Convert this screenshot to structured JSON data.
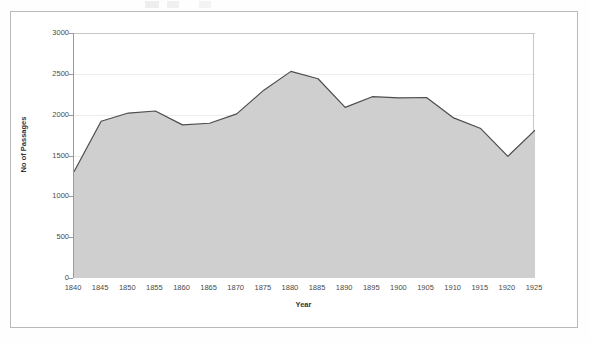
{
  "chart_data": {
    "type": "area",
    "title": "",
    "xlabel": "Year",
    "ylabel": "No of Passages",
    "x": [
      1840,
      1845,
      1850,
      1855,
      1860,
      1865,
      1870,
      1875,
      1880,
      1885,
      1890,
      1895,
      1900,
      1905,
      1910,
      1915,
      1920,
      1925
    ],
    "values": [
      1300,
      1920,
      2020,
      2045,
      1875,
      1895,
      2010,
      2300,
      2530,
      2440,
      2090,
      2220,
      2205,
      2210,
      1960,
      1830,
      1490,
      1810
    ],
    "xtick_labels": [
      "1840",
      "1845",
      "1850",
      "1855",
      "1860",
      "1865",
      "1870",
      "1875",
      "1880",
      "1885",
      "1890",
      "1895",
      "1900",
      "1905",
      "1910",
      "1915",
      "1920",
      "1925"
    ],
    "ytick_values": [
      0,
      500,
      1000,
      1500,
      2000,
      2500,
      3000
    ],
    "ytick_labels": [
      "0",
      "500",
      "1000",
      "1500",
      "2000",
      "2500",
      "3000"
    ],
    "ylim": [
      0,
      3000
    ],
    "xlim": [
      1840,
      1925
    ],
    "grid": true,
    "legend": false,
    "series_name": "No of Passages",
    "colors": {
      "area_fill": "#cfcfcf",
      "line": "#4d4d4d",
      "gridline": "#ededed",
      "axis": "#9a9a9a",
      "text": "#4a4a4a",
      "frame": "#b9b9b9",
      "background": "#ffffff"
    }
  }
}
